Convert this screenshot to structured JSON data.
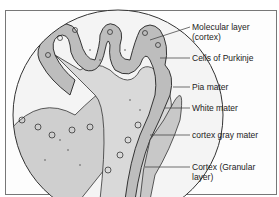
{
  "diagram": {
    "labels": [
      {
        "id": "molecular-layer",
        "line1": "Molecular layer",
        "line2": "(cortex)"
      },
      {
        "id": "purkinje-cells",
        "line1": "Cells of Purkinje"
      },
      {
        "id": "pia-mater",
        "line1": "Pia mater"
      },
      {
        "id": "white-mater",
        "line1": "White mater"
      },
      {
        "id": "cortex-gray-mater",
        "line1": "cortex gray mater"
      },
      {
        "id": "granular-layer",
        "line1": "Cortex (Granular",
        "line2": "layer)"
      }
    ]
  }
}
